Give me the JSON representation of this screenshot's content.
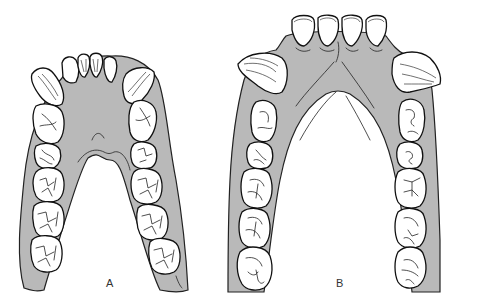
{
  "figure": {
    "type": "anatomical illustration",
    "colors": {
      "gum": "#b9b9b9",
      "tooth": "#ffffff",
      "outline": "#111111",
      "background": "#ffffff"
    },
    "panels": [
      {
        "id": "A",
        "label": "A",
        "arch_shape": "narrow V-shaped / parabolic",
        "teeth": {
          "incisors": 4,
          "canines": 2,
          "premolars_per_side": 2,
          "molars_per_side": 3
        }
      },
      {
        "id": "B",
        "label": "B",
        "arch_shape": "wide U-shaped with large projecting canines",
        "teeth": {
          "incisors": 4,
          "canines": 2,
          "premolars_per_side": 2,
          "molars_per_side": 3
        }
      }
    ]
  }
}
